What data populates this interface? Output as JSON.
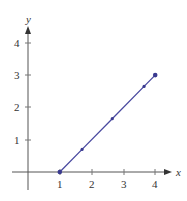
{
  "chart_data": {
    "type": "line",
    "title": "",
    "xlabel": "x",
    "ylabel": "y",
    "xlim": [
      0,
      4.4
    ],
    "ylim": [
      0,
      4.4
    ],
    "xticks": [
      1,
      2,
      3,
      4
    ],
    "yticks": [
      1,
      2,
      3,
      4
    ],
    "grid": false,
    "legend": null,
    "series": [
      {
        "name": "line",
        "color": "#4a4aa0",
        "x": [
          1,
          1.7,
          2.65,
          3.65,
          4
        ],
        "y": [
          0,
          0.7,
          1.65,
          2.65,
          3
        ],
        "markers": true,
        "note": "Endpoints (1,0) and (4,3) lie on labeled gridlines; interior points are estimated from pixel positions and lie approximately on y = x - 1"
      }
    ]
  },
  "axes": {
    "x_label": "x",
    "y_label": "y",
    "x_ticks": [
      "1",
      "2",
      "3",
      "4"
    ],
    "y_ticks": [
      "1",
      "2",
      "3",
      "4"
    ]
  }
}
